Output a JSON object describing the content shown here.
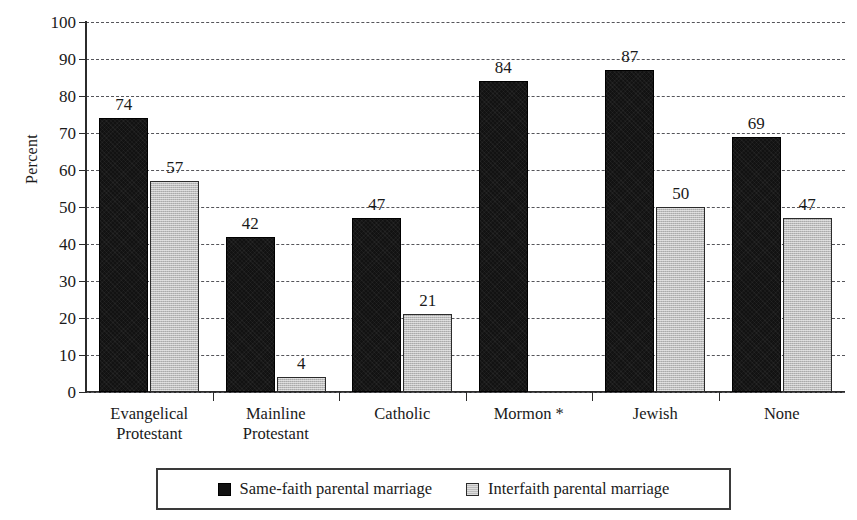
{
  "chart_data": {
    "type": "bar",
    "title": "",
    "xlabel": "",
    "ylabel": "Percent",
    "ylim": [
      0,
      100
    ],
    "ytick_step": 10,
    "yticks": [
      0,
      10,
      20,
      30,
      40,
      50,
      60,
      70,
      80,
      90,
      100
    ],
    "grid": true,
    "grid_style": "dashed-horizontal",
    "legend_position": "bottom-center",
    "categories": [
      "Evangelical\nProtestant",
      "Mainline\nProtestant",
      "Catholic",
      "Mormon *",
      "Jewish",
      "None"
    ],
    "category_lines": [
      [
        "Evangelical",
        "Protestant"
      ],
      [
        "Mainline",
        "Protestant"
      ],
      [
        "Catholic"
      ],
      [
        "Mormon *"
      ],
      [
        "Jewish"
      ],
      [
        "None"
      ]
    ],
    "series": [
      {
        "name": "Same-faith parental marriage",
        "color": "#121212",
        "values": [
          74,
          42,
          47,
          84,
          87,
          69
        ]
      },
      {
        "name": "Interfaith parental marriage",
        "color": "#bdbdbd",
        "values": [
          57,
          4,
          21,
          null,
          50,
          47
        ]
      }
    ],
    "value_labels": {
      "same_faith": [
        "74",
        "42",
        "47",
        "84",
        "87",
        "69"
      ],
      "interfaith": [
        "57",
        "4",
        "21",
        "",
        "50",
        "47"
      ]
    }
  },
  "legend": {
    "items": [
      {
        "label": "Same-faith parental marriage",
        "swatch": "dark-square-swatch"
      },
      {
        "label": "Interfaith parental marriage",
        "swatch": "light-square-swatch"
      }
    ]
  },
  "colors": {
    "same_faith": "#121212",
    "interfaith": "#bdbdbd",
    "axis": "#2b2b2b",
    "grid": "#55555a",
    "background": "#ffffff",
    "text": "#1a1a1a"
  }
}
